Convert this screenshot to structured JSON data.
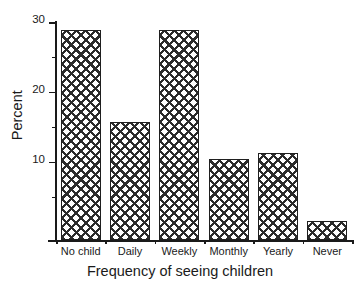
{
  "chart_data": {
    "type": "bar",
    "title": "",
    "xlabel": "Frequency of seeing children",
    "ylabel": "Percent",
    "categories": [
      "No child",
      "Daily",
      "Weekly",
      "Monthly",
      "Yearly",
      "Never"
    ],
    "values": [
      28.8,
      15.7,
      28.8,
      10.4,
      11.2,
      1.5
    ],
    "ylim": [
      -1.2,
      30
    ],
    "yticks": [
      10,
      20,
      30
    ],
    "ytick_labels": [
      "10",
      "20",
      "30"
    ],
    "yminor_ticks": [
      5,
      15,
      25
    ],
    "grid": false,
    "legend": null,
    "legend_position": "none",
    "bar_fill": "crosshatch",
    "bar_edge_color": "#1f1f1f",
    "bar_hatch_color": "#2b2b2b",
    "background_color": "#ffffff",
    "axis_color": "#1a1a1a"
  },
  "axes": {
    "y_title": "Percent",
    "x_title": "Frequency of seeing children",
    "y_labels": [
      {
        "text": "30",
        "value": 30
      },
      {
        "text": "20",
        "value": 20
      },
      {
        "text": "10",
        "value": 10
      }
    ]
  },
  "bars": [
    {
      "label": "No child",
      "value": 28.8
    },
    {
      "label": "Daily",
      "value": 15.7
    },
    {
      "label": "Weekly",
      "value": 28.8
    },
    {
      "label": "Monthly",
      "value": 10.4
    },
    {
      "label": "Yearly",
      "value": 11.2
    },
    {
      "label": "Never",
      "value": 1.5
    }
  ]
}
